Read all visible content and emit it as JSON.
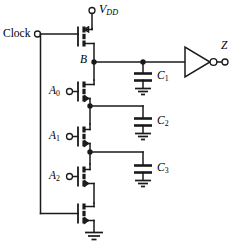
{
  "figure": {
    "kind": "schematic",
    "width": 235,
    "height": 250,
    "line_color": "#1a1a1a",
    "text_color": "#000000",
    "background": "#ffffff"
  },
  "labels": {
    "clock": "Clock",
    "vdd": "V",
    "vdd_sub": "DD",
    "node_b": "B",
    "output_z": "Z",
    "input_a0": "A",
    "input_a0_sub": "0",
    "input_a1": "A",
    "input_a1_sub": "1",
    "input_a2": "A",
    "input_a2_sub": "2",
    "cap_c1": "C",
    "cap_c1_sub": "1",
    "cap_c2": "C",
    "cap_c2_sub": "2",
    "cap_c3": "C",
    "cap_c3_sub": "3"
  },
  "terminals": [
    {
      "name": "clock-terminal",
      "label": "Clock",
      "x": 37,
      "y": 34
    },
    {
      "name": "vdd-terminal",
      "label": "VDD",
      "x": 92,
      "y": 10
    },
    {
      "name": "a0-terminal",
      "label": "A0",
      "x": 63,
      "y": 92
    },
    {
      "name": "a1-terminal",
      "label": "A1",
      "x": 63,
      "y": 132
    },
    {
      "name": "a2-terminal",
      "label": "A2",
      "x": 63,
      "y": 172
    },
    {
      "name": "z-terminal",
      "label": "Z",
      "x": 225,
      "y": 55
    }
  ],
  "transistors": [
    {
      "name": "pmos-precharge",
      "type": "pmos",
      "gate_input": "Clock",
      "y": 38
    },
    {
      "name": "nmos-a0",
      "type": "nmos",
      "gate_input": "A0",
      "y": 92
    },
    {
      "name": "nmos-a1",
      "type": "nmos",
      "gate_input": "A1",
      "y": 132
    },
    {
      "name": "nmos-a2",
      "type": "nmos",
      "gate_input": "A2",
      "y": 172
    },
    {
      "name": "nmos-evaluate",
      "type": "nmos",
      "gate_input": "Clock",
      "y": 215
    }
  ],
  "capacitors": [
    {
      "name": "capacitor-c1",
      "label": "C1",
      "x": 143,
      "y": 78
    },
    {
      "name": "capacitor-c2",
      "label": "C2",
      "x": 143,
      "y": 123
    },
    {
      "name": "capacitor-c3",
      "label": "C3",
      "x": 143,
      "y": 170
    }
  ],
  "nodes": [
    {
      "name": "node-b",
      "label": "B",
      "x": 94,
      "y": 62
    },
    {
      "name": "node-c1-tap",
      "label": "",
      "x": 143,
      "y": 62
    },
    {
      "name": "node-c2-tap",
      "label": "",
      "x": 90,
      "y": 106
    },
    {
      "name": "node-c3-tap",
      "label": "",
      "x": 90,
      "y": 152
    }
  ],
  "gates": [
    {
      "name": "output-inverter",
      "type": "inverter",
      "x": 185,
      "y": 62
    }
  ],
  "grounds": [
    {
      "name": "ground-c1",
      "x": 143,
      "y": 92
    },
    {
      "name": "ground-c2",
      "x": 143,
      "y": 137
    },
    {
      "name": "ground-c3",
      "x": 143,
      "y": 184
    },
    {
      "name": "ground-source",
      "x": 94,
      "y": 238
    }
  ]
}
